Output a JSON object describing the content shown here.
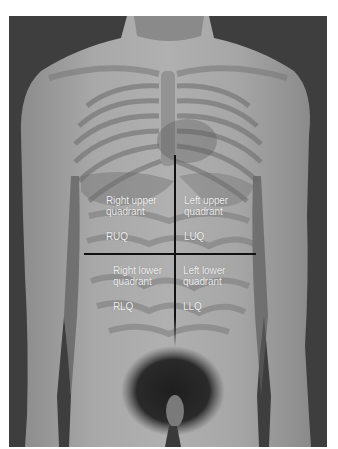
{
  "figure": {
    "colors": {
      "background": "#3e3e3e",
      "skin": "#9c9c9c",
      "skin_light": "#b4b4b4",
      "label_text": "#f2f2f2",
      "divider_line": "#111111"
    },
    "quadrants": [
      {
        "id": "ruq",
        "line1": "Right upper",
        "line2": "quadrant",
        "abbr": "RUQ"
      },
      {
        "id": "luq",
        "line1": "Left upper",
        "line2": "quadrant",
        "abbr": "LUQ"
      },
      {
        "id": "rlq",
        "line1": "Right lower",
        "line2": "quadrant",
        "abbr": "RLQ"
      },
      {
        "id": "llq",
        "line1": "Left lower",
        "line2": "quadrant",
        "abbr": "LLQ"
      }
    ]
  }
}
